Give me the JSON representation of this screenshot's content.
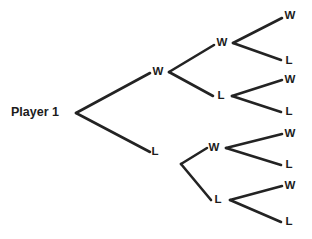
{
  "diagram": {
    "type": "probability-tree",
    "title": "Player 1",
    "colors": {
      "background": "#ffffff",
      "line": "#232323",
      "text": "#1c1c1c"
    },
    "root": {
      "label": "Player 1",
      "x": 11,
      "y": 113,
      "vertex_x": 76,
      "vertex_y": 113
    },
    "level1": [
      {
        "id": "l1-w",
        "label": "W",
        "x": 158,
        "y": 72,
        "vertex_x": 169,
        "vertex_y": 72
      },
      {
        "id": "l1-l",
        "label": "L",
        "x": 155,
        "y": 152,
        "vertex_x": 181,
        "vertex_y": 164
      }
    ],
    "level2": [
      {
        "id": "l2-ww",
        "label": "W",
        "parent": "l1-w",
        "x": 222,
        "y": 43,
        "vertex_x": 233,
        "vertex_y": 43
      },
      {
        "id": "l2-wl",
        "label": "L",
        "parent": "l1-w",
        "x": 221,
        "y": 96,
        "vertex_x": 232,
        "vertex_y": 96
      },
      {
        "id": "l2-lw",
        "label": "W",
        "parent": "l1-l",
        "x": 214,
        "y": 148,
        "vertex_x": 226,
        "vertex_y": 148
      },
      {
        "id": "l2-ll",
        "label": "L",
        "parent": "l1-l",
        "x": 218,
        "y": 200,
        "vertex_x": 230,
        "vertex_y": 200
      }
    ],
    "leaves": [
      {
        "id": "leaf-www",
        "label": "W",
        "parent": "l2-ww",
        "x": 290,
        "y": 16
      },
      {
        "id": "leaf-wwl",
        "label": "L",
        "parent": "l2-ww",
        "x": 289,
        "y": 61
      },
      {
        "id": "leaf-wlw",
        "label": "W",
        "parent": "l2-wl",
        "x": 290,
        "y": 80
      },
      {
        "id": "leaf-wll",
        "label": "L",
        "parent": "l2-wl",
        "x": 289,
        "y": 112
      },
      {
        "id": "leaf-lww",
        "label": "W",
        "parent": "l2-lw",
        "x": 290,
        "y": 134
      },
      {
        "id": "leaf-lwl",
        "label": "L",
        "parent": "l2-lw",
        "x": 289,
        "y": 165
      },
      {
        "id": "leaf-llw",
        "label": "W",
        "parent": "l2-ll",
        "x": 290,
        "y": 186
      },
      {
        "id": "leaf-lll",
        "label": "L",
        "parent": "l2-ll",
        "x": 289,
        "y": 222
      }
    ],
    "edges": [
      {
        "id": "edge-root-w",
        "x1": 76,
        "y1": 113,
        "x2": 150,
        "y2": 73
      },
      {
        "id": "edge-root-l",
        "x1": 76,
        "y1": 113,
        "x2": 150,
        "y2": 152
      },
      {
        "id": "edge-w-ww",
        "x1": 169,
        "y1": 72,
        "x2": 214,
        "y2": 45
      },
      {
        "id": "edge-w-wl",
        "x1": 169,
        "y1": 72,
        "x2": 213,
        "y2": 96
      },
      {
        "id": "edge-l-lw",
        "x1": 181,
        "y1": 164,
        "x2": 207,
        "y2": 148
      },
      {
        "id": "edge-l-ll",
        "x1": 181,
        "y1": 164,
        "x2": 211,
        "y2": 200
      },
      {
        "id": "edge-ww-w",
        "x1": 233,
        "y1": 43,
        "x2": 282,
        "y2": 18
      },
      {
        "id": "edge-ww-l",
        "x1": 233,
        "y1": 43,
        "x2": 281,
        "y2": 60
      },
      {
        "id": "edge-wl-w",
        "x1": 232,
        "y1": 96,
        "x2": 282,
        "y2": 80
      },
      {
        "id": "edge-wl-l",
        "x1": 232,
        "y1": 96,
        "x2": 281,
        "y2": 112
      },
      {
        "id": "edge-lw-w",
        "x1": 226,
        "y1": 148,
        "x2": 282,
        "y2": 134
      },
      {
        "id": "edge-lw-l",
        "x1": 226,
        "y1": 148,
        "x2": 281,
        "y2": 165
      },
      {
        "id": "edge-ll-w",
        "x1": 230,
        "y1": 200,
        "x2": 282,
        "y2": 186
      },
      {
        "id": "edge-ll-l",
        "x1": 230,
        "y1": 200,
        "x2": 281,
        "y2": 222
      }
    ]
  }
}
